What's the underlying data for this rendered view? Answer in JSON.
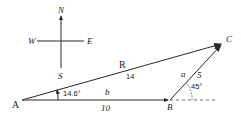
{
  "compass": {
    "north": "N",
    "south": "S",
    "east": "E",
    "west": "W"
  },
  "points": {
    "A": "A",
    "B": "B",
    "C": "C"
  },
  "vectors": {
    "resultant": {
      "name": "R",
      "magnitude": "14"
    },
    "b": {
      "name": "b",
      "magnitude": "10"
    },
    "a": {
      "name": "a",
      "magnitude": "5"
    }
  },
  "angles": {
    "at_A": "14.6°",
    "at_B": "45°"
  },
  "colors": {
    "ink": "#2a2a2a",
    "background": "#ffffff"
  }
}
